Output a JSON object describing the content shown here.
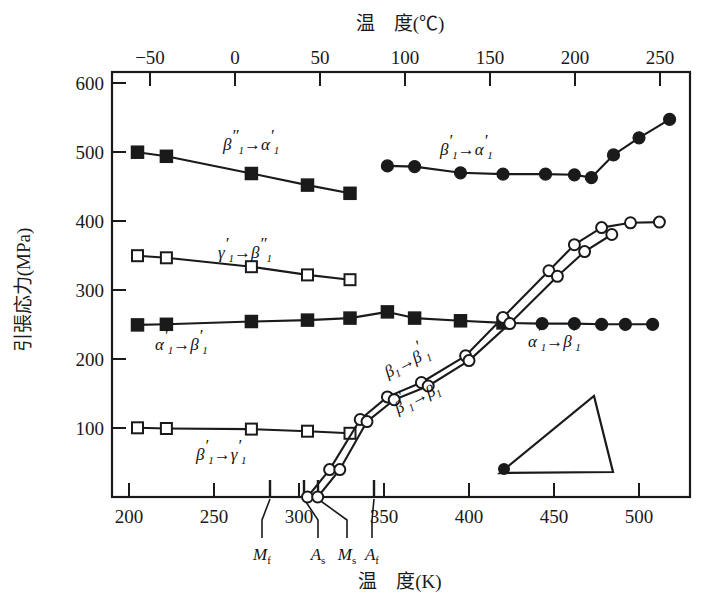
{
  "figure": {
    "title": "",
    "bottom_axis_title": "温　度(K)",
    "top_axis_title": "温　度(℃)",
    "y_axis_title": "引張応力(MPa)"
  },
  "axes": {
    "x_bottom": {
      "label": "温　度(K)",
      "unit": "K",
      "min": 190,
      "max": 530,
      "ticks": [
        200,
        250,
        300,
        350,
        400,
        450,
        500
      ],
      "tick_labels": [
        "200",
        "250",
        "300",
        "350",
        "400",
        "450",
        "500"
      ]
    },
    "x_top": {
      "label": "温　度(℃)",
      "unit": "℃",
      "ticks": [
        -50,
        0,
        50,
        100,
        150,
        200,
        250
      ],
      "tick_labels": [
        "−50",
        "0",
        "50",
        "100",
        "150",
        "200",
        "250"
      ]
    },
    "y": {
      "label": "引張応力(MPa)",
      "unit": "MPa",
      "min": 0,
      "max": 620,
      "ticks": [
        100,
        200,
        300,
        400,
        500,
        600
      ],
      "tick_labels": [
        "100",
        "200",
        "300",
        "400",
        "500",
        "600"
      ]
    }
  },
  "transformation_markers": [
    {
      "name": "Mf",
      "symbol": "M",
      "subscript": "f",
      "temperature_K": 283,
      "label": "M_f"
    },
    {
      "name": "As",
      "symbol": "A",
      "subscript": "s",
      "temperature_K": 303,
      "label": "A_s"
    },
    {
      "name": "Ms",
      "symbol": "M",
      "subscript": "s",
      "temperature_K": 311,
      "label": "M_s"
    },
    {
      "name": "Af",
      "symbol": "A",
      "subscript": "f",
      "temperature_K": 344,
      "label": "A_f"
    }
  ],
  "chart_data": {
    "type": "line",
    "title": "",
    "xlabel": "温　度(K)",
    "ylabel": "引張応力(MPa)",
    "xlim": [
      190,
      530
    ],
    "ylim": [
      0,
      620
    ],
    "grid": false,
    "legend": "inline-labels",
    "series": [
      {
        "name": "β''₁→α'₁",
        "label": "β''1→α'1",
        "marker": "filled-square",
        "points": [
          {
            "x": 205,
            "y": 503
          },
          {
            "x": 222,
            "y": 497
          },
          {
            "x": 272,
            "y": 472
          },
          {
            "x": 305,
            "y": 455
          },
          {
            "x": 330,
            "y": 443
          }
        ]
      },
      {
        "name": "β'₁→α'₁",
        "label": "β'1→α'1",
        "marker": "filled-circle",
        "points": [
          {
            "x": 352,
            "y": 483
          },
          {
            "x": 368,
            "y": 482
          },
          {
            "x": 395,
            "y": 473
          },
          {
            "x": 420,
            "y": 471
          },
          {
            "x": 445,
            "y": 471
          },
          {
            "x": 462,
            "y": 470
          },
          {
            "x": 472,
            "y": 466
          },
          {
            "x": 485,
            "y": 499
          },
          {
            "x": 500,
            "y": 524
          },
          {
            "x": 518,
            "y": 551
          }
        ]
      },
      {
        "name": "γ'₁→β''₁",
        "label": "γ'1→β''1",
        "marker": "open-square",
        "points": [
          {
            "x": 205,
            "y": 352
          },
          {
            "x": 222,
            "y": 349
          },
          {
            "x": 272,
            "y": 336
          },
          {
            "x": 305,
            "y": 324
          },
          {
            "x": 330,
            "y": 317
          }
        ]
      },
      {
        "name": "α'₁→β'₁ (low-T branch)",
        "label": "α'1→β'1",
        "marker": "filled-square",
        "points": [
          {
            "x": 205,
            "y": 251
          },
          {
            "x": 222,
            "y": 252
          },
          {
            "x": 272,
            "y": 256
          },
          {
            "x": 305,
            "y": 258
          },
          {
            "x": 330,
            "y": 261
          },
          {
            "x": 352,
            "y": 270
          },
          {
            "x": 368,
            "y": 261
          },
          {
            "x": 395,
            "y": 257
          },
          {
            "x": 420,
            "y": 254
          }
        ]
      },
      {
        "name": "α'₁→β'₁ (high-T branch)",
        "label": "α'1→β'1",
        "marker": "filled-circle",
        "points": [
          {
            "x": 420,
            "y": 254
          },
          {
            "x": 443,
            "y": 253
          },
          {
            "x": 462,
            "y": 253
          },
          {
            "x": 478,
            "y": 252
          },
          {
            "x": 492,
            "y": 252
          },
          {
            "x": 508,
            "y": 252
          }
        ]
      },
      {
        "name": "β'₁→γ'₁",
        "label": "β'1→γ'1",
        "marker": "open-square",
        "points": [
          {
            "x": 205,
            "y": 101
          },
          {
            "x": 222,
            "y": 100
          },
          {
            "x": 272,
            "y": 99
          },
          {
            "x": 305,
            "y": 96
          },
          {
            "x": 330,
            "y": 93
          }
        ]
      },
      {
        "name": "β₁→β'₁",
        "label": "β1→β'1",
        "marker": "open-circle",
        "points": [
          {
            "x": 305,
            "y": 0
          },
          {
            "x": 318,
            "y": 40
          },
          {
            "x": 336,
            "y": 113
          },
          {
            "x": 352,
            "y": 146
          },
          {
            "x": 372,
            "y": 167
          },
          {
            "x": 398,
            "y": 206
          },
          {
            "x": 420,
            "y": 262
          },
          {
            "x": 447,
            "y": 330
          },
          {
            "x": 462,
            "y": 368
          },
          {
            "x": 478,
            "y": 393
          },
          {
            "x": 495,
            "y": 400
          },
          {
            "x": 512,
            "y": 401
          }
        ]
      },
      {
        "name": "β'₁→β₁",
        "label": "β'1→β1",
        "marker": "open-circle",
        "points": [
          {
            "x": 311,
            "y": 0
          },
          {
            "x": 324,
            "y": 40
          },
          {
            "x": 340,
            "y": 110
          },
          {
            "x": 356,
            "y": 142
          },
          {
            "x": 376,
            "y": 162
          },
          {
            "x": 400,
            "y": 199
          },
          {
            "x": 424,
            "y": 253
          },
          {
            "x": 452,
            "y": 322
          },
          {
            "x": 468,
            "y": 358
          },
          {
            "x": 484,
            "y": 383
          }
        ]
      }
    ],
    "inline_labels": [
      {
        "text": "β''1→α'1",
        "x_K": 262,
        "y_MPa": 535
      },
      {
        "text": "β'1→α'1",
        "x_K": 432,
        "y_MPa": 515
      },
      {
        "text": "γ'1→β''1",
        "x_K": 258,
        "y_MPa": 385
      },
      {
        "text": "α'1→β'1",
        "x_K": 228,
        "y_MPa": 222
      },
      {
        "text": "α'1→β'1",
        "x_K": 465,
        "y_MPa": 226
      },
      {
        "text": "β1→β'1",
        "x_K": 378,
        "y_MPa": 190
      },
      {
        "text": "β'1→β1",
        "x_K": 386,
        "y_MPa": 140
      },
      {
        "text": "β'1→γ'1",
        "x_K": 248,
        "y_MPa": 68
      }
    ],
    "inset": {
      "type": "triangle-schematic",
      "marker": "filled-circle",
      "note": "small triangle outline with filled dot at lower-left vertex"
    }
  },
  "colors": {
    "line": "#1a1a1a",
    "marker_fill": "#1a1a1a",
    "marker_open": "#ffffff",
    "background": "#ffffff",
    "text": "#1a1a1a"
  }
}
